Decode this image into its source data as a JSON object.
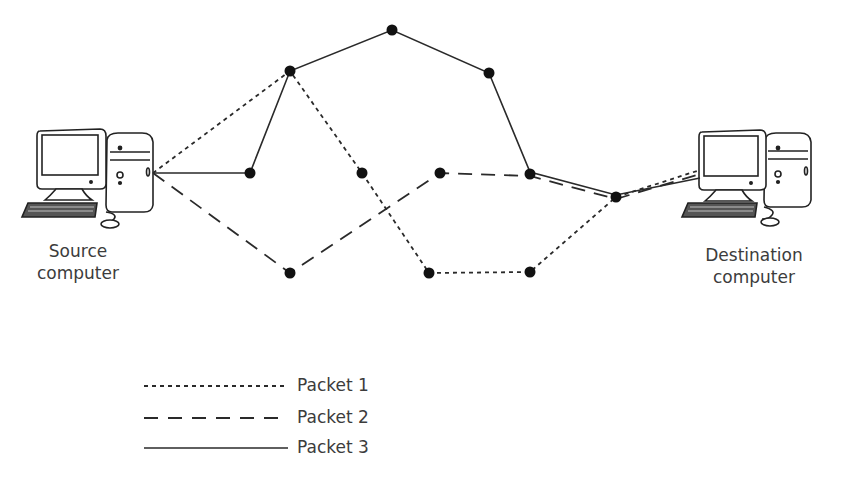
{
  "diagram": {
    "source": {
      "line1": "Source",
      "line2": "computer"
    },
    "destination": {
      "line1": "Destination",
      "line2": "computer"
    },
    "nodes": [
      {
        "id": "n1",
        "x": 250,
        "y": 173
      },
      {
        "id": "n2",
        "x": 290,
        "y": 71
      },
      {
        "id": "n3",
        "x": 392,
        "y": 30
      },
      {
        "id": "n4",
        "x": 489,
        "y": 73
      },
      {
        "id": "n5",
        "x": 362,
        "y": 173
      },
      {
        "id": "n6",
        "x": 440,
        "y": 173
      },
      {
        "id": "n7",
        "x": 530,
        "y": 174
      },
      {
        "id": "n8",
        "x": 616,
        "y": 197
      },
      {
        "id": "n9",
        "x": 290,
        "y": 273
      },
      {
        "id": "n10",
        "x": 429,
        "y": 273
      },
      {
        "id": "n11",
        "x": 530,
        "y": 272
      }
    ],
    "paths": [
      {
        "packet": "Packet 1",
        "style": "dotted",
        "route": [
          "source",
          "n2",
          "n5",
          "n10",
          "n11",
          "n8",
          "destination"
        ]
      },
      {
        "packet": "Packet 2",
        "style": "dashed",
        "route": [
          "source",
          "n9",
          "n6",
          "n7",
          "n8",
          "destination"
        ]
      },
      {
        "packet": "Packet 3",
        "style": "solid",
        "route": [
          "source",
          "n1",
          "n2",
          "n3",
          "n4",
          "n7",
          "n8",
          "destination"
        ]
      }
    ]
  },
  "legend": {
    "items": [
      {
        "label": "Packet 1",
        "style": "dotted"
      },
      {
        "label": "Packet 2",
        "style": "dashed"
      },
      {
        "label": "Packet 3",
        "style": "solid"
      }
    ]
  },
  "colors": {
    "line": "#2a2a2a",
    "node": "#111111",
    "text": "#3c3c3c"
  }
}
